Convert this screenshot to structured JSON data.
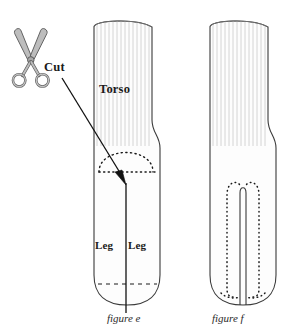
{
  "diagram": {
    "background_color": "#ffffff",
    "outline_color": "#3a3a3a",
    "rib_color": "#c9c9c9",
    "sock_fill": "#fdfdfd",
    "dot_color": "#1a1a1a",
    "scissors_fill": "#b9b9b9",
    "scissors_stroke": "#5a5a5a"
  },
  "labels": {
    "cut": "Cut",
    "torso": "Torso",
    "leg_left": "Leg",
    "leg_right": "Leg"
  },
  "captions": {
    "figure_e": "figure e",
    "figure_f": "figure f"
  },
  "icons": {
    "scissors": "scissors-icon"
  },
  "figures": [
    {
      "id": "figure-e",
      "caption": "figure e",
      "description": "Sock with ribbed cuff labelled Torso, dotted dome stitch line, solid vertical cut line, two Leg labels and dashed toe line",
      "annotations": [
        "Torso",
        "Leg",
        "Leg",
        "dotted dome",
        "cut line",
        "dashed toe line"
      ]
    },
    {
      "id": "figure-f",
      "caption": "figure f",
      "description": "Sock after cutting: open slit down the centre with dotted U-shaped stitch line around it",
      "annotations": [
        "open slit",
        "dotted stitch outline"
      ]
    }
  ]
}
